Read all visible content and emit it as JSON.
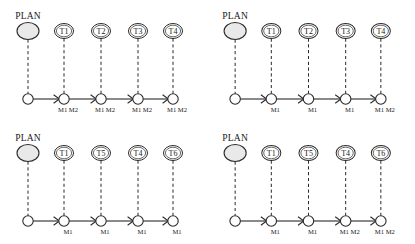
{
  "figure": {
    "background_color": "#ffffff",
    "line_color": "#2b2b2b",
    "plan_fill_color": "#e9e9e9",
    "node_fill_color": "#ffffff",
    "panel_count": 4
  },
  "panels": [
    {
      "id": "panel-top-left",
      "plan": {
        "label": "PLAN"
      },
      "tasks": [
        {
          "label": "T1",
          "machines": "M1 M2"
        },
        {
          "label": "T2",
          "machines": "M1 M2"
        },
        {
          "label": "T3",
          "machines": "M1 M2"
        },
        {
          "label": "T4",
          "machines": "M1 M2"
        }
      ]
    },
    {
      "id": "panel-top-right",
      "plan": {
        "label": "PLAN"
      },
      "tasks": [
        {
          "label": "T1",
          "machines": "M1"
        },
        {
          "label": "T2",
          "machines": "M1"
        },
        {
          "label": "T3",
          "machines": "M1"
        },
        {
          "label": "T4",
          "machines": "M1 M2"
        }
      ]
    },
    {
      "id": "panel-bottom-left",
      "plan": {
        "label": "PLAN"
      },
      "tasks": [
        {
          "label": "T1",
          "machines": "M1"
        },
        {
          "label": "T5",
          "machines": "M1"
        },
        {
          "label": "T4",
          "machines": "M1"
        },
        {
          "label": "T6",
          "machines": "M1"
        }
      ]
    },
    {
      "id": "panel-bottom-right",
      "plan": {
        "label": "PLAN"
      },
      "tasks": [
        {
          "label": "T1",
          "machines": "M1"
        },
        {
          "label": "T5",
          "machines": "M1"
        },
        {
          "label": "T4",
          "machines": "M1 M2"
        },
        {
          "label": "T6",
          "machines": "M1 M2"
        }
      ]
    }
  ],
  "geometry": {
    "plan_center_x": 28,
    "plan_center_y": 31,
    "plan_rx": 11,
    "plan_ry": 8.5,
    "task_centers_x": [
      64,
      101,
      138,
      173
    ],
    "task_center_y": 31,
    "task_rx": 9.5,
    "task_ry": 7.5,
    "op_row_y": 99,
    "op_radius": 5.2,
    "machine_label_y": 112
  }
}
